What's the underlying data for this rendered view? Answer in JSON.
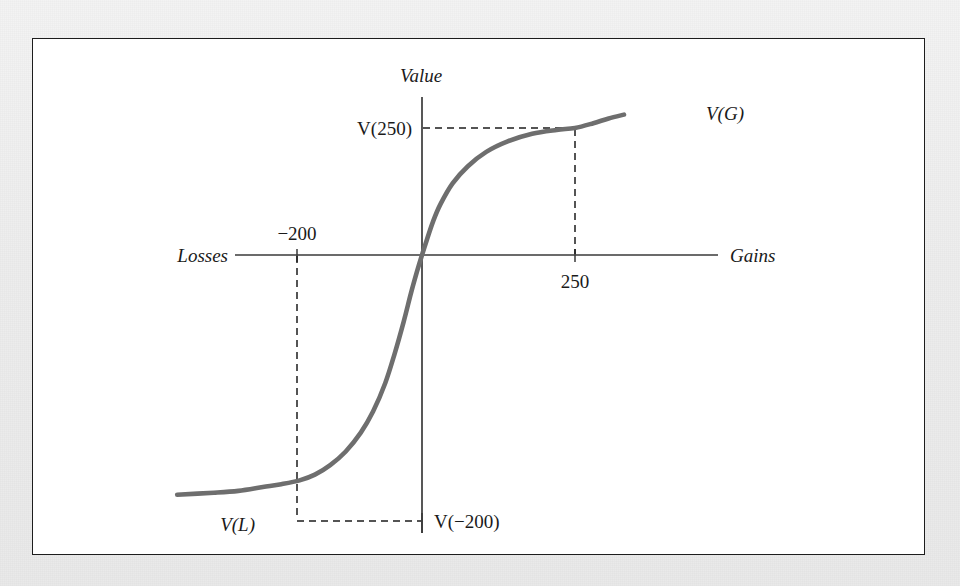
{
  "figure": {
    "background_color": "#efefef",
    "panel_color": "#ffffff",
    "frame_color": "#1d1d1d"
  },
  "chart_data": {
    "type": "line",
    "title": "",
    "subtitle": "",
    "xlabel": "Gains",
    "xlabel_left": "Losses",
    "ylabel": "Value",
    "grid": false,
    "legend": "none",
    "axes": {
      "x_axis_label_right": "Gains",
      "x_axis_label_left": "Losses",
      "y_axis_label": "Value",
      "origin_label": "",
      "xlim": [
        -420,
        340
      ],
      "ylim": [
        -1.35,
        1.0
      ]
    },
    "xticks": [
      {
        "value": -200,
        "label": "-200"
      },
      {
        "value": 250,
        "label": "250"
      }
    ],
    "yticks": [
      {
        "value": 0.66,
        "label": "V(250)"
      },
      {
        "value": -1.18,
        "label": "V(-200)"
      }
    ],
    "annotations": [
      {
        "name": "gain-curve-label",
        "label": "V(G)",
        "x": 330,
        "y": 0.84
      },
      {
        "name": "loss-curve-label",
        "label": "V(L)",
        "x": -395,
        "y": -1.18
      }
    ],
    "reference_lines": [
      {
        "name": "gain-horizontal-dashed",
        "orientation": "horizontal",
        "from_x": 0,
        "to_x": 250,
        "y": 0.66,
        "style": "dashed"
      },
      {
        "name": "gain-vertical-dashed",
        "orientation": "vertical",
        "x": 250,
        "from_y": 0,
        "to_y": 0.66,
        "style": "dashed"
      },
      {
        "name": "loss-horizontal-dashed",
        "orientation": "horizontal",
        "from_x": -200,
        "to_x": 0,
        "y": -1.18,
        "style": "dashed"
      },
      {
        "name": "loss-vertical-dashed",
        "orientation": "vertical",
        "x": -200,
        "from_y": 0,
        "to_y": -1.18,
        "style": "dashed"
      }
    ],
    "series": [
      {
        "name": "value-function",
        "color": "#6e6e6e",
        "points": [
          {
            "x": -400,
            "y": -1.255
          },
          {
            "x": -340,
            "y": -1.245
          },
          {
            "x": -300,
            "y": -1.235
          },
          {
            "x": -260,
            "y": -1.215
          },
          {
            "x": -230,
            "y": -1.2
          },
          {
            "x": -200,
            "y": -1.18
          },
          {
            "x": -175,
            "y": -1.15
          },
          {
            "x": -150,
            "y": -1.1
          },
          {
            "x": -125,
            "y": -1.03
          },
          {
            "x": -100,
            "y": -0.93
          },
          {
            "x": -80,
            "y": -0.82
          },
          {
            "x": -60,
            "y": -0.67
          },
          {
            "x": -45,
            "y": -0.52
          },
          {
            "x": -30,
            "y": -0.35
          },
          {
            "x": -18,
            "y": -0.2
          },
          {
            "x": -8,
            "y": -0.085
          },
          {
            "x": 0,
            "y": 0.0
          },
          {
            "x": 8,
            "y": 0.08
          },
          {
            "x": 18,
            "y": 0.175
          },
          {
            "x": 30,
            "y": 0.265
          },
          {
            "x": 50,
            "y": 0.375
          },
          {
            "x": 75,
            "y": 0.465
          },
          {
            "x": 105,
            "y": 0.54
          },
          {
            "x": 140,
            "y": 0.595
          },
          {
            "x": 180,
            "y": 0.635
          },
          {
            "x": 220,
            "y": 0.655
          },
          {
            "x": 250,
            "y": 0.665
          },
          {
            "x": 280,
            "y": 0.69
          },
          {
            "x": 305,
            "y": 0.715
          },
          {
            "x": 330,
            "y": 0.735
          }
        ]
      }
    ]
  },
  "labels": {
    "value": "Value",
    "gains": "Gains",
    "losses": "Losses",
    "tick_minus_200": "−200",
    "tick_250": "250",
    "v_250": "V(250)",
    "v_minus_200": "V(−200)",
    "v_g": "V(G)",
    "v_l": "V(L)"
  }
}
